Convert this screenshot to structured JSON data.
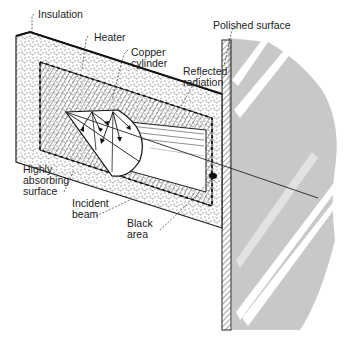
{
  "diagram": {
    "type": "cutaway-technical-illustration",
    "labels": {
      "insulation": "Insulation",
      "heater": "Heater",
      "copper_cylinder": "Copper\ncylinder",
      "reflected_radiation": "Reflected\nradiation",
      "polished_surface": "Polished surface",
      "highly_absorbing_surface": "Highly\nabsorbing\nsurface",
      "incident_beam": "Incident\nbeam",
      "black_area": "Black\narea"
    },
    "colors": {
      "ink": "#222222",
      "shade": "#c8c8c8",
      "shade_light": "#e2e2e2",
      "background": "#ffffff"
    }
  }
}
